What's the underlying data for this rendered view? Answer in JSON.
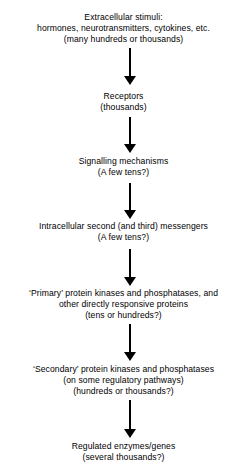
{
  "diagram": {
    "background_color": "#ffffff",
    "text_color": "#000000",
    "arrow_color": "#000000",
    "nodes": [
      {
        "id": "extracellular-stimuli",
        "lines": [
          "Extracellular stimuli:",
          "hormones, neurotransmitters, cytokines, etc.",
          "(many hundreds or thousands)"
        ]
      },
      {
        "id": "receptors",
        "lines": [
          "Receptors",
          "(thousands)"
        ]
      },
      {
        "id": "signalling-mechanisms",
        "lines": [
          "Signalling mechanisms",
          "(A few tens?)"
        ]
      },
      {
        "id": "second-messengers",
        "lines": [
          "Intracellular second (and third) messengers",
          "(A few tens?)"
        ]
      },
      {
        "id": "primary-protein-kinases",
        "lines": [
          "‘Primary’ protein kinases and phosphatases, and",
          "other directly responsive proteins",
          "(tens or hundreds?)"
        ]
      },
      {
        "id": "secondary-protein-kinases",
        "lines": [
          "‘Secondary’ protein kinases and phosphatases",
          "(on some regulatory pathways)",
          "(hundreds or thousands?)"
        ]
      },
      {
        "id": "regulated-enzymes-genes",
        "lines": [
          "Regulated enzymes/genes",
          "(several thousands?)"
        ]
      }
    ],
    "arrows": [
      {
        "id": "arrow-stimuli-to-receptors",
        "direction": "down"
      },
      {
        "id": "arrow-receptors-to-signalling",
        "direction": "down"
      },
      {
        "id": "arrow-signalling-to-messengers",
        "direction": "down"
      },
      {
        "id": "arrow-messengers-to-primary",
        "direction": "down"
      },
      {
        "id": "arrow-primary-to-secondary",
        "direction": "down"
      },
      {
        "id": "arrow-secondary-to-regulated",
        "direction": "down"
      }
    ]
  }
}
